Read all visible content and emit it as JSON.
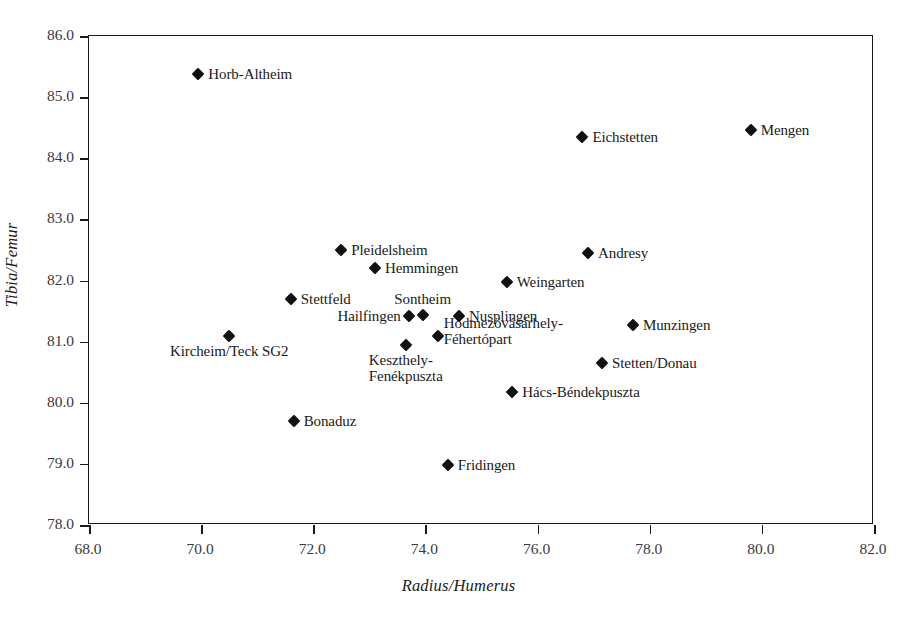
{
  "chart_data": {
    "type": "scatter",
    "title": "",
    "xlabel": "Radius/Humerus",
    "ylabel": "Tibia/Femur",
    "xlim": [
      68.0,
      82.0
    ],
    "ylim": [
      78.0,
      86.0
    ],
    "xticks": [
      "68.0",
      "70.0",
      "72.0",
      "74.0",
      "76.0",
      "78.0",
      "80.0",
      "82.0"
    ],
    "yticks": [
      "78.0",
      "79.0",
      "80.0",
      "81.0",
      "82.0",
      "83.0",
      "84.0",
      "85.0",
      "86.0"
    ],
    "grid": false,
    "legend": "none",
    "marker_shape": "diamond",
    "marker_color": "#111111",
    "points": [
      {
        "label": "Horb-Altheim",
        "x": 69.95,
        "y": 85.38,
        "label_pos": "right"
      },
      {
        "label": "Eichstetten",
        "x": 76.8,
        "y": 84.35,
        "label_pos": "right"
      },
      {
        "label": "Mengen",
        "x": 79.8,
        "y": 84.47,
        "label_pos": "right"
      },
      {
        "label": "Pleidelsheim",
        "x": 72.5,
        "y": 82.5,
        "label_pos": "right"
      },
      {
        "label": "Hemmingen",
        "x": 73.1,
        "y": 82.2,
        "label_pos": "right"
      },
      {
        "label": "Andresy",
        "x": 76.9,
        "y": 82.45,
        "label_pos": "right"
      },
      {
        "label": "Weingarten",
        "x": 75.45,
        "y": 81.98,
        "label_pos": "right"
      },
      {
        "label": "Stettfeld",
        "x": 71.6,
        "y": 81.69,
        "label_pos": "right"
      },
      {
        "label": "Sontheim",
        "x": 73.95,
        "y": 81.44,
        "label_pos": "above"
      },
      {
        "label": "Hailfingen",
        "x": 73.7,
        "y": 81.42,
        "label_pos": "left"
      },
      {
        "label": "Nusplingen",
        "x": 74.6,
        "y": 81.42,
        "label_pos": "right"
      },
      {
        "label": "Munzingen",
        "x": 77.7,
        "y": 81.27,
        "label_pos": "right"
      },
      {
        "label": "Hódmezövásárhely-Féhertópart",
        "x": 74.22,
        "y": 81.1,
        "label_pos": "right"
      },
      {
        "label": "Kircheim/Teck SG2",
        "x": 70.5,
        "y": 81.1,
        "label_pos": "below"
      },
      {
        "label": "Keszthely-Fenékpuszta",
        "x": 73.65,
        "y": 80.95,
        "label_pos": "below"
      },
      {
        "label": "Stetten/Donau",
        "x": 77.15,
        "y": 80.65,
        "label_pos": "right"
      },
      {
        "label": "Hács-Béndekpuszta",
        "x": 75.55,
        "y": 80.18,
        "label_pos": "right"
      },
      {
        "label": "Bonaduz",
        "x": 71.65,
        "y": 79.7,
        "label_pos": "right"
      },
      {
        "label": "Fridingen",
        "x": 74.4,
        "y": 78.98,
        "label_pos": "right"
      }
    ]
  }
}
